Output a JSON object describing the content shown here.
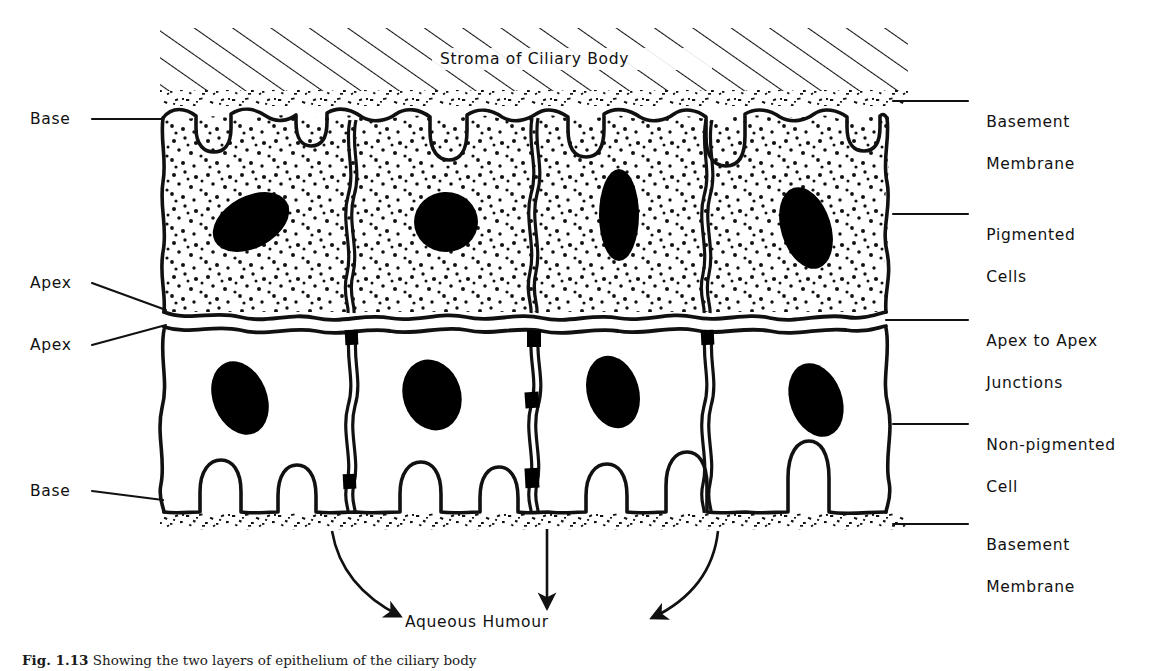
{
  "figure": {
    "title_label": "Stroma of Ciliary Body",
    "outflow_label": "Aqueous Humour",
    "left_labels": [
      {
        "id": "base-top",
        "text": "Base"
      },
      {
        "id": "apex-pigmented",
        "text": "Apex"
      },
      {
        "id": "apex-nonpigmented",
        "text": "Apex"
      },
      {
        "id": "base-bottom",
        "text": "Base"
      }
    ],
    "right_labels": [
      {
        "id": "basement-membrane-top",
        "line1": "Basement",
        "line2": "Membrane"
      },
      {
        "id": "pigmented-cells",
        "line1": "Pigmented",
        "line2": "Cells"
      },
      {
        "id": "apex-to-apex-junctions",
        "line1": "Apex to Apex",
        "line2": "Junctions"
      },
      {
        "id": "non-pigmented-cell",
        "line1": "Non-pigmented",
        "line2": "Cell"
      },
      {
        "id": "basement-membrane-bottom",
        "line1": "Basement",
        "line2": "Membrane"
      }
    ],
    "layers": [
      {
        "name": "Stroma of Ciliary Body",
        "fill": "diagonal-hatch"
      },
      {
        "name": "Basement Membrane",
        "fill": "stipple-band"
      },
      {
        "name": "Pigmented Cells",
        "fill": "stippled-cytoplasm",
        "count": 4
      },
      {
        "name": "Apex to Apex Junctions",
        "fill": "wavy-double-line"
      },
      {
        "name": "Non-pigmented Cell",
        "fill": "clear-cytoplasm",
        "count": 4
      },
      {
        "name": "Basement Membrane",
        "fill": "stipple-band"
      }
    ],
    "arrows": [
      {
        "id": "arrow-left",
        "style": "curved"
      },
      {
        "id": "arrow-center",
        "style": "straight"
      },
      {
        "id": "arrow-right",
        "style": "curved"
      }
    ],
    "colors": {
      "ink": "#111111",
      "background": "#ffffff",
      "nucleus": "#000000"
    }
  },
  "caption": {
    "figure_number": "Fig. 1.13",
    "text": "Showing the two layers of epithelium of the ciliary body"
  }
}
